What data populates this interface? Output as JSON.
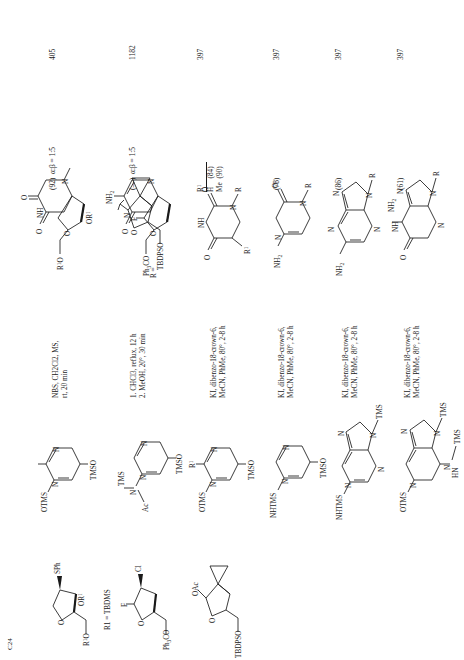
{
  "page": {
    "kind": "organic-reactions-table",
    "orientation": "rotated-90-ccw",
    "series_label": "C24"
  },
  "columns": {
    "substrate": "Substrate",
    "reagent": "Silylated base",
    "conditions": "Conditions",
    "product": "Product(s) and Yield(s) (%)",
    "refs": "Refs."
  },
  "rows": [
    {
      "id": "row-1",
      "substrate": {
        "labels": [
          "R1O",
          "O",
          "OR1",
          "SPh"
        ],
        "note": "R1 = TBDMS"
      },
      "reagent": {
        "labels": [
          "OTMS",
          "N",
          "N",
          "TMSO"
        ],
        "name": "bis-O-trimethylsilyl thymine"
      },
      "conditions": [
        "NBS, CH2Cl2, MS,",
        "rt, 20 min"
      ],
      "conditions_text": "NBS, CH2Cl2, MS, rt, 20 min",
      "product": {
        "labels": [
          "O",
          "NH",
          "O",
          "N",
          "O",
          "OR1",
          "R1O"
        ],
        "name": "thymidine nucleoside"
      },
      "yield": "(92)",
      "ratio": "α:β = 1:5",
      "ref": "405"
    },
    {
      "id": "row-2",
      "substrate": {
        "labels": [
          "Ph3CO",
          "O",
          "F",
          "Cl"
        ],
        "note": ""
      },
      "reagent": {
        "labels": [
          "Ac",
          "N",
          "TMS",
          "N",
          "N",
          "TMSO"
        ],
        "name": "N4-acetyl bis-silyl cytosine"
      },
      "conditions": [
        "1. CHCl3, reflux, 12 h",
        "2. MeOH, 20°, 30 min"
      ],
      "conditions_text": "1. CHCl3, reflux, 12 h; 2. MeOH, 20°, 30 min",
      "product": {
        "labels": [
          "NH2",
          "N",
          "O",
          "N",
          "O",
          "F",
          "Ph3CO"
        ],
        "name": "2'-fluoro cytidine nucleoside"
      },
      "yield": "(—)",
      "ratio": "α:β = 1:5",
      "ref": "1182"
    },
    {
      "id": "row-3",
      "substrate": {
        "labels": [
          "TBDPSO",
          "O",
          "OAc"
        ],
        "note": "cyclopropyl acetate donor"
      },
      "reagent": {
        "labels": [
          "OTMS",
          "R1",
          "N",
          "N",
          "TMSO"
        ],
        "name": "bis-O-silylated uracil / thymine"
      },
      "conditions": [
        "KI, dibenzo-18-crown-6,",
        "MeCN, PhMe, 80°, 2-8 h"
      ],
      "conditions_text": "KI, dibenzo-18-crown-6, MeCN, PhMe, 80°, 2-8 h",
      "product": {
        "labels": [
          "O",
          "NH",
          "O",
          "N",
          "R",
          "R1"
        ],
        "name": "uracil N-nucleoside"
      },
      "subtable": {
        "header": "R1",
        "rows": [
          {
            "r1": "H",
            "yield": "(84)"
          },
          {
            "r1": "Me",
            "yield": "(90)"
          }
        ]
      },
      "ref": "397"
    },
    {
      "id": "row-4",
      "substrate": null,
      "reagent": {
        "labels": [
          "NHTMS",
          "N",
          "N",
          "TMSO"
        ],
        "name": "silylated cytosine"
      },
      "conditions": [
        "KI, dibenzo-18-crown-6,",
        "MeCN, PhMe, 80°, 2-8 h"
      ],
      "conditions_text": "KI, dibenzo-18-crown-6, MeCN, PhMe, 80°, 2-8 h",
      "product": {
        "labels": [
          "NH2",
          "N",
          "O",
          "N",
          "R"
        ],
        "name": "cytosine N-nucleoside"
      },
      "yield": "(78)",
      "ref": "397"
    },
    {
      "id": "row-5",
      "substrate": null,
      "reagent": {
        "labels": [
          "NHTMS",
          "N",
          "N",
          "N",
          "N",
          "TMS"
        ],
        "name": "silylated adenine"
      },
      "conditions": [
        "KI, dibenzo-18-crown-6,",
        "MeCN, PhMe, 80°, 2-8 h"
      ],
      "conditions_text": "KI, dibenzo-18-crown-6, MeCN, PhMe, 80°, 2-8 h",
      "product": {
        "labels": [
          "NH2",
          "N",
          "N",
          "N",
          "N",
          "R"
        ],
        "name": "adenine N-nucleoside"
      },
      "yield": "(86)",
      "ref": "397"
    },
    {
      "id": "row-6",
      "substrate": null,
      "reagent": {
        "labels": [
          "OTMS",
          "N",
          "N",
          "TMS",
          "N",
          "HN",
          "TMS"
        ],
        "name": "silylated guanine"
      },
      "conditions": [
        "KI, dibenzo-18-crown-6,",
        "MeCN, PhMe, 80°, 2-8 h"
      ],
      "conditions_text": "KI, dibenzo-18-crown-6, MeCN, PhMe, 80°, 2-8 h",
      "product": {
        "labels": [
          "O",
          "NH",
          "NH2",
          "N",
          "N",
          "N",
          "R"
        ],
        "name": "guanine N-nucleoside"
      },
      "yield": "(61)",
      "ref": "397"
    }
  ],
  "r_definition": {
    "label": "R =",
    "labels": [
      "TBDPSO",
      "O"
    ],
    "name": "cyclopropyl-furanose R group"
  }
}
